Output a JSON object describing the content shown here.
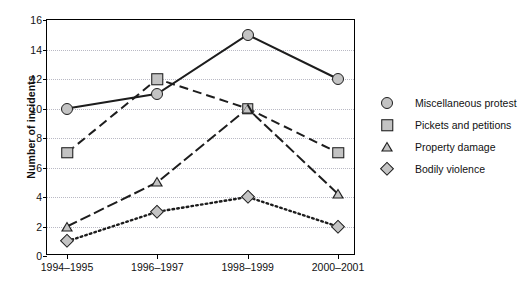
{
  "chart_data": {
    "type": "line",
    "title": "",
    "xlabel": "",
    "ylabel": "Number of incidents",
    "categories": [
      "1994–1995",
      "1996–1997",
      "1998–1999",
      "2000–2001"
    ],
    "ylim": [
      0,
      16
    ],
    "ytick_step": 2,
    "yticks": [
      "0",
      "2",
      "4",
      "6",
      "8",
      "10",
      "12",
      "14",
      "16"
    ],
    "grid": "horizontal-dotted",
    "legend_position": "right",
    "series": [
      {
        "name": "Miscellaneous protest",
        "marker": "circle",
        "linestyle": "solid",
        "values": [
          10,
          11,
          15,
          12
        ]
      },
      {
        "name": "Pickets and petitions",
        "marker": "square",
        "linestyle": "dashed",
        "values": [
          7,
          12,
          10,
          7
        ]
      },
      {
        "name": "Property damage",
        "marker": "triangle",
        "linestyle": "dash-dot",
        "values": [
          2,
          5,
          10,
          4.2
        ]
      },
      {
        "name": "Bodily violence",
        "marker": "diamond",
        "linestyle": "dotted",
        "values": [
          1,
          3,
          4,
          2
        ]
      }
    ],
    "colors": {
      "line": "#1d1d1d",
      "marker_fill": "#c3c3c3",
      "marker_edge": "#1d1d1d",
      "gridline": "#b9b9c4",
      "axis": "#000000",
      "background": "#ffffff"
    }
  },
  "caption": {
    "text": " "
  }
}
